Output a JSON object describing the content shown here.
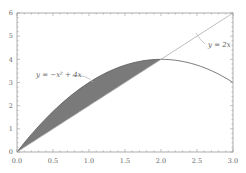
{
  "chart_data": {
    "type": "line",
    "title": "",
    "xlabel": "",
    "ylabel": "",
    "xlim": [
      0,
      3
    ],
    "ylim": [
      0,
      6
    ],
    "grid": false,
    "x_ticks": [
      "0.0",
      "0.5",
      "1.0",
      "1.5",
      "2.0",
      "2.5",
      "3.0"
    ],
    "y_ticks": [
      "0",
      "1",
      "2",
      "3",
      "4",
      "5",
      "6"
    ],
    "series": [
      {
        "name": "y = -x^2 + 4x",
        "expression": "-x^2+4x",
        "x": [
          0,
          0.5,
          1.0,
          1.5,
          2.0,
          2.5,
          3.0
        ],
        "values": [
          0,
          1.75,
          3,
          3.75,
          4,
          3.75,
          3
        ]
      },
      {
        "name": "y = 2x",
        "expression": "2x",
        "x": [
          0,
          0.5,
          1.0,
          1.5,
          2.0,
          2.5,
          3.0
        ],
        "values": [
          0,
          1,
          2,
          3,
          4,
          5,
          6
        ]
      }
    ],
    "shaded_region": {
      "between": [
        "-x^2+4x",
        "2x"
      ],
      "x_range": [
        0,
        2
      ],
      "color": "#7a7a7a"
    },
    "annotations": [
      {
        "text": "y = −x² + 4x",
        "points_to": "parabola"
      },
      {
        "text": "y = 2x",
        "points_to": "line"
      }
    ]
  },
  "labels": {
    "parabola": "y = −x² + 4x",
    "line": "y = 2x"
  },
  "colors": {
    "curve": "#555555",
    "shade": "#7a7a7a",
    "axis": "#999999",
    "background": "#ffffff"
  }
}
